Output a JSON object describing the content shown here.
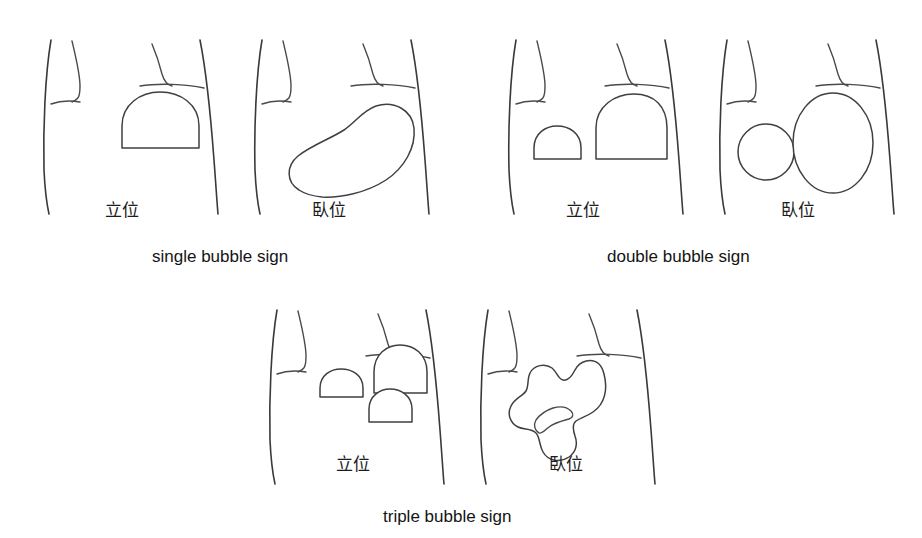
{
  "figure": {
    "background_color": "#ffffff",
    "line_color": "#3a3a3e",
    "text_color": "#141414"
  },
  "position_labels": {
    "standing": "立位",
    "supine": "臥位"
  },
  "captions": {
    "single": "single bubble sign",
    "double": "double bubble sign",
    "triple": "triple bubble sign"
  },
  "panels": [
    {
      "id": "single-standing",
      "sign": "single bubble sign",
      "position": "立位",
      "position_meaning": "standing",
      "bubble_count": 1,
      "bubble_shape": "dome-with-flat-air-fluid-level"
    },
    {
      "id": "single-supine",
      "sign": "single bubble sign",
      "position": "臥位",
      "position_meaning": "supine",
      "bubble_count": 1,
      "bubble_shape": "kidney-bean-outline"
    },
    {
      "id": "double-standing",
      "sign": "double bubble sign",
      "position": "立位",
      "position_meaning": "standing",
      "bubble_count": 2,
      "bubble_shape": "two-domes-with-flat-air-fluid-levels"
    },
    {
      "id": "double-supine",
      "sign": "double bubble sign",
      "position": "臥位",
      "position_meaning": "supine",
      "bubble_count": 2,
      "bubble_shape": "two-adjoining-ovals"
    },
    {
      "id": "triple-standing",
      "sign": "triple bubble sign",
      "position": "立位",
      "position_meaning": "standing",
      "bubble_count": 3,
      "bubble_shape": "three-domes-with-flat-air-fluid-levels"
    },
    {
      "id": "triple-supine",
      "sign": "triple bubble sign",
      "position": "臥位",
      "position_meaning": "supine",
      "bubble_count": 3,
      "bubble_shape": "lobulated-trilobed-outline"
    }
  ]
}
